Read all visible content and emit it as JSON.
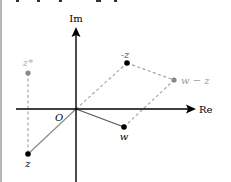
{
  "diagram": {
    "axes": {
      "real_label": "Re",
      "imag_label": "Im",
      "origin_label": "O"
    },
    "points": [
      {
        "id": "z",
        "label": "z",
        "color": "#000000"
      },
      {
        "id": "neg_z",
        "label": "-z",
        "color": "#000000"
      },
      {
        "id": "z_conj",
        "label": "z*",
        "color": "#888888"
      },
      {
        "id": "w",
        "label": "w",
        "color": "#000000"
      },
      {
        "id": "w_minus_z",
        "label": "w − z",
        "color": "#888888"
      }
    ],
    "colors": {
      "axis": "#000000",
      "vector": "#888888",
      "dashed": "#999999",
      "gray_point": "#888888",
      "black_point": "#000000",
      "gray_label": "#999999"
    }
  }
}
